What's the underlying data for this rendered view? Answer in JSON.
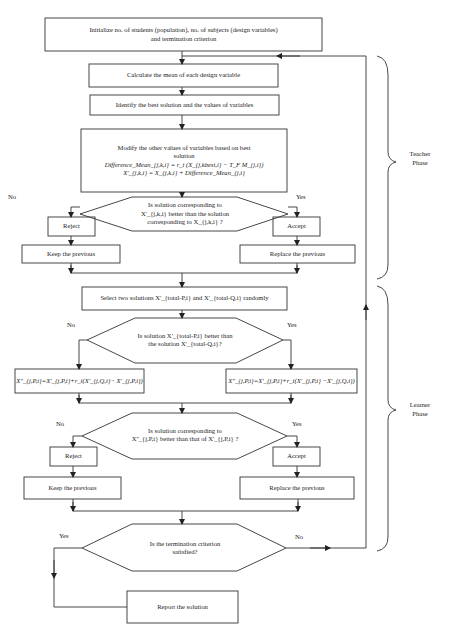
{
  "flowchart": {
    "init": {
      "line1": "Initialize no. of students (population), no. of subjects (design variables)",
      "line2": "and termination criterion"
    },
    "calc_mean": "Calculate the mean of each design variable",
    "identify_best": "Identify the best solution and the values of variables",
    "modify": {
      "line1": "Modify the other values of variables based on best",
      "line2": "solution",
      "formula1": "Difference_Mean_{j,k,i} = r_i (X_{j,kbest,i} − T_F M_{j,i})",
      "formula2": "X'_{j,k,i} = X_{j,k,i} + Difference_Mean_{j,i}"
    },
    "decision1": {
      "line1": "Is solution corresponding to",
      "line2": "X'_{j,k,i} better than the solution",
      "line3": "corresponding to X_{j,k,i} ?",
      "no": "No",
      "yes": "Yes"
    },
    "reject1": "Reject",
    "accept1": "Accept",
    "keep1": "Keep the previous",
    "replace1": "Replace the previous",
    "select": "Select two solutions X'_{total-P,i} and X'_{total-Q,i} randomly",
    "decision2": {
      "line1": "Is solution X'_{total-P,i} better than",
      "line2": "the solution X'_{total-Q,i}?",
      "no": "No",
      "yes": "Yes"
    },
    "formula_left": "X''_{j,P,i}=X'_{j,P,i}+r_i(X'_{j,Q,i}− X'_{j,P,i})",
    "formula_right": "X''_{j,P,i}=X'_{j,P,i}+r_i(X'_{j,P,i} −X'_{j,Q,i})",
    "decision3": {
      "line1": "Is solution corresponding to",
      "line2": "X''_{j,P,i} better than that of X'_{j,P,i} ?",
      "no": "No",
      "yes": "Yes"
    },
    "reject2": "Reject",
    "accept2": "Accept",
    "keep2": "Keep the previous",
    "replace2": "Replace the previous",
    "decision4": {
      "line1": "Is the termination criterion",
      "line2": "satisfied?",
      "yes": "Yes",
      "no": "No"
    },
    "report": "Report the solution"
  },
  "phases": {
    "teacher": {
      "line1": "Teacher",
      "line2": "Phase"
    },
    "learner": {
      "line1": "Learner",
      "line2": "Phase"
    }
  },
  "colors": {
    "stroke": "#333333",
    "background": "#ffffff",
    "text": "#222222"
  }
}
